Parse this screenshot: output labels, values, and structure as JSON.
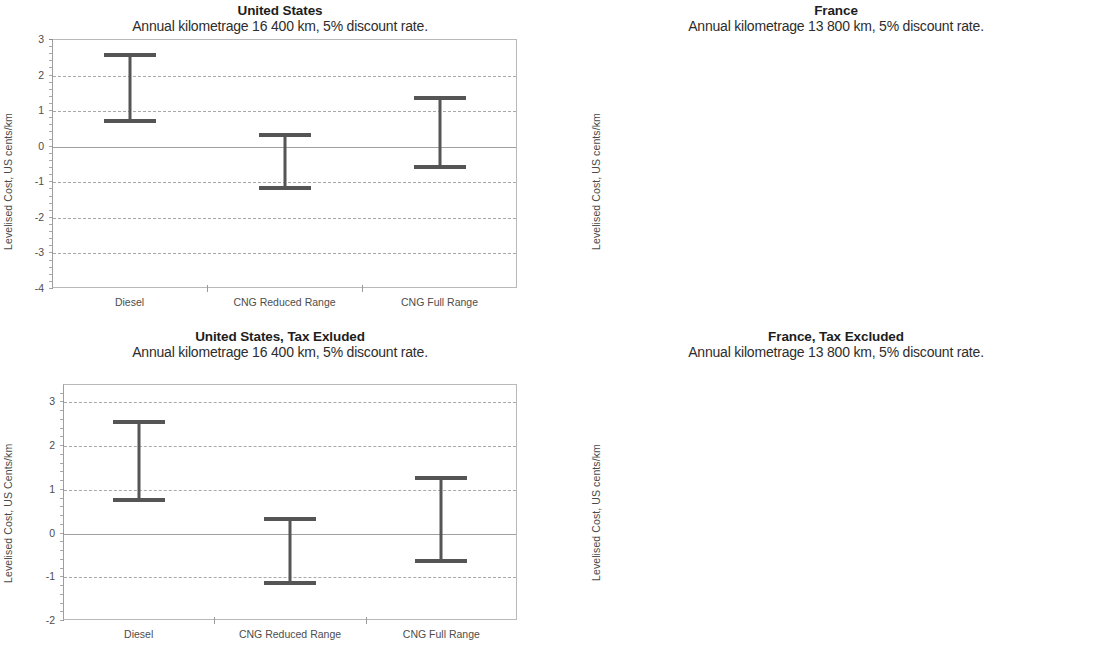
{
  "figure": {
    "panel_count": 4,
    "categories": [
      "Diesel",
      "CNG Reduced Range",
      "CNG Full Range"
    ],
    "axis_color": "#b9b9b9",
    "bar_color": "#555555",
    "grid_color": "#a9a9a9"
  },
  "panels": [
    {
      "id": "united-states",
      "title": "United States",
      "subtitle": "Annual kilometrage 16 400 km, 5% discount rate.",
      "ylabel": "Levelised Cost, US cents/km",
      "yticks": [
        "3",
        "2",
        "1",
        "0",
        "-1",
        "-2",
        "-3",
        "-4"
      ]
    },
    {
      "id": "france",
      "title": "France",
      "subtitle": "Annual kilometrage 13 800 km, 5% discount rate.",
      "ylabel": "Levelised Cost, US cents/km",
      "yticks": [
        "3",
        "2",
        "1",
        "0",
        "-1",
        "-2",
        "-3",
        "-4"
      ]
    },
    {
      "id": "united-states-tax-exluded",
      "title": "United States, Tax Exluded",
      "subtitle": "Annual kilometrage 16 400 km, 5% discount rate.",
      "ylabel": "Levelised Cost, US Cents/km",
      "yticks": [
        "3",
        "2",
        "1",
        "0",
        "-1",
        "-2"
      ]
    },
    {
      "id": "france-tax-excluded",
      "title": "France, Tax Excluded",
      "subtitle": "Annual kilometrage 13 800 km, 5% discount rate.",
      "ylabel": "Levelised Cost, US cents/km",
      "yticks": [
        "3",
        "2",
        "1",
        "0",
        "-1",
        "-2"
      ]
    }
  ],
  "chart_data": [
    {
      "type": "bar",
      "subtype": "range-interval (high-low bar with caps)",
      "title": "United States",
      "subtitle": "Annual kilometrage 16 400 km, 5% discount rate.",
      "xlabel": "",
      "ylabel": "Levelised Cost, US cents/km",
      "ylim": [
        -4,
        3
      ],
      "yticks": [
        3,
        2,
        1,
        0,
        -1,
        -2,
        -3,
        -4
      ],
      "grid": true,
      "legend": "none",
      "categories": [
        "Diesel",
        "CNG Reduced Range",
        "CNG Full Range"
      ],
      "series": [
        {
          "name": "high",
          "values": [
            2.6,
            0.35,
            1.4
          ]
        },
        {
          "name": "low",
          "values": [
            0.65,
            -1.25,
            -0.65
          ]
        }
      ]
    },
    {
      "type": "bar",
      "subtype": "range-interval (high-low bar with caps)",
      "title": "France",
      "subtitle": "Annual kilometrage 13 800 km, 5% discount rate.",
      "xlabel": "",
      "ylabel": "Levelised Cost, US cents/km",
      "ylim": [
        -4,
        3
      ],
      "yticks": [
        3,
        2,
        1,
        0,
        -1,
        -2,
        -3,
        -4
      ],
      "grid": true,
      "legend": "none",
      "categories": [
        "Diesel",
        "CNG Reduced Range",
        "CNG Full Range"
      ],
      "series": [
        {
          "name": "high",
          "values": [
            0.18,
            0.56,
            1.62
          ]
        },
        {
          "name": "low",
          "values": [
            -3.82,
            -0.57,
            0.06
          ]
        }
      ]
    },
    {
      "type": "bar",
      "subtype": "range-interval (high-low bar with caps)",
      "title": "United States, Tax Exluded",
      "subtitle": "Annual kilometrage 16 400 km, 5% discount rate.",
      "xlabel": "",
      "ylabel": "Levelised Cost, US Cents/km",
      "ylim": [
        -2,
        3.4
      ],
      "yticks": [
        3,
        2,
        1,
        0,
        -1,
        -2
      ],
      "grid": true,
      "legend": "none",
      "categories": [
        "Diesel",
        "CNG Reduced Range",
        "CNG Full Range"
      ],
      "series": [
        {
          "name": "high",
          "values": [
            2.58,
            0.35,
            1.3
          ]
        },
        {
          "name": "low",
          "values": [
            0.71,
            -1.2,
            -0.7
          ]
        }
      ]
    },
    {
      "type": "bar",
      "subtype": "range-interval (high-low bar with caps)",
      "title": "France, Tax Excluded",
      "subtitle": "Annual kilometrage 13 800 km, 5% discount rate.",
      "xlabel": "",
      "ylabel": "Levelised Cost, US cents/km",
      "ylim": [
        -2,
        3.4
      ],
      "yticks": [
        3,
        2,
        1,
        0,
        -1,
        -2
      ],
      "grid": true,
      "legend": "none",
      "categories": [
        "Diesel",
        "CNG Reduced Range",
        "CNG Full Range"
      ],
      "series": [
        {
          "name": "high",
          "values": [
            3.05,
            0.62,
            1.39
          ]
        },
        {
          "name": "low",
          "values": [
            -0.54,
            -0.42,
            -0.03
          ]
        }
      ]
    }
  ]
}
